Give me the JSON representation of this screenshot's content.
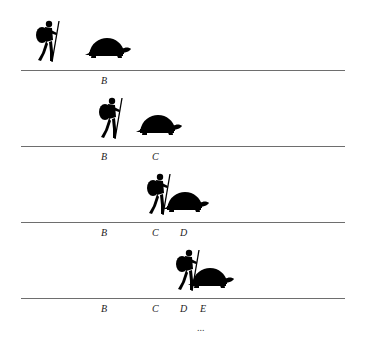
{
  "colors": {
    "line": "#6e6e6e",
    "figure": "#000000",
    "background": "#ffffff"
  },
  "rows": [
    {
      "line_y": 70,
      "achilles_x": 33,
      "achilles_y": 20,
      "tortoise_x": 85,
      "tortoise_y": 37,
      "labels": [
        {
          "text": "B",
          "x": 101
        }
      ]
    },
    {
      "line_y": 146,
      "achilles_x": 96,
      "achilles_y": 97,
      "tortoise_x": 136,
      "tortoise_y": 114,
      "labels": [
        {
          "text": "B",
          "x": 101
        },
        {
          "text": "C",
          "x": 152
        }
      ]
    },
    {
      "line_y": 222,
      "achilles_x": 144,
      "achilles_y": 173,
      "tortoise_x": 163,
      "tortoise_y": 191,
      "labels": [
        {
          "text": "B",
          "x": 101
        },
        {
          "text": "C",
          "x": 152
        },
        {
          "text": "D",
          "x": 180
        }
      ]
    },
    {
      "line_y": 298,
      "achilles_x": 173,
      "achilles_y": 249,
      "tortoise_x": 188,
      "tortoise_y": 267,
      "labels": [
        {
          "text": "B",
          "x": 101
        },
        {
          "text": "C",
          "x": 152
        },
        {
          "text": "D",
          "x": 180
        },
        {
          "text": "E",
          "x": 200
        }
      ]
    }
  ],
  "ellipsis": "..."
}
